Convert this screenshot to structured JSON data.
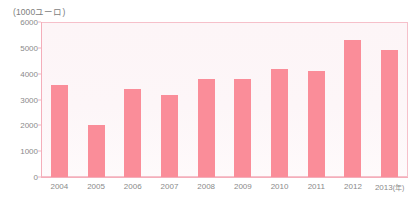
{
  "chart_data": {
    "type": "bar",
    "title": "",
    "subtitle": "",
    "unit_label": "(1000ユーロ)",
    "xlabel": "",
    "ylabel": "",
    "x_axis_suffix": "(年)",
    "categories": [
      "2004",
      "2005",
      "2006",
      "2007",
      "2008",
      "2009",
      "2010",
      "2011",
      "2012",
      "2013"
    ],
    "values": [
      3550,
      2000,
      3400,
      3180,
      3780,
      3780,
      4190,
      4090,
      5320,
      4920
    ],
    "ylim": [
      0,
      6000
    ],
    "y_ticks": [
      0,
      1000,
      2000,
      3000,
      4000,
      5000,
      6000
    ],
    "y_tick_labels": [
      "0",
      "1000",
      "2000",
      "3000",
      "4000",
      "5000",
      "6000"
    ],
    "x_tick_labels": [
      "2004",
      "2005",
      "2006",
      "2007",
      "2008",
      "2009",
      "2010",
      "2011",
      "2012",
      "2013(年)"
    ],
    "grid": false,
    "legend": null,
    "legend_position": "none",
    "bar_color": "#fa8d99",
    "plot_background": "#fdf5f7",
    "axis_color": "#f4aeba",
    "tick_label_color": "#8a8a8a",
    "data_labels_shown": false
  }
}
